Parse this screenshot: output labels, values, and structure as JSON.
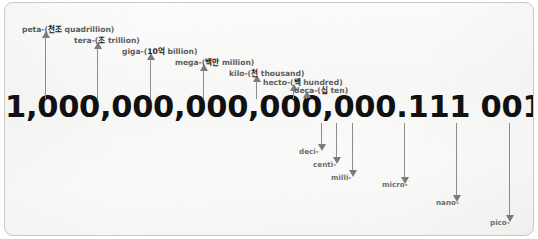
{
  "number": {
    "text": "1,000,000,000,000,000.111 001 001 001",
    "color": "#111111"
  },
  "style": {
    "arrow_color": "#7a7a7a",
    "label_color": "#5e5e5e",
    "border_color": "#c9c9c9",
    "background_color": "#f9f9f8"
  },
  "big_prefixes": [
    {
      "prefix": "peta-",
      "paren_open": "(",
      "korean": "천조",
      "english": "quadrillion",
      "paren_close": ")",
      "arrow_x": 40,
      "arrow_top": 28,
      "arrow_bottom": 96,
      "label_x": 17,
      "label_y": 20
    },
    {
      "prefix": "tera-",
      "paren_open": "(",
      "korean": "조",
      "english": "trillion",
      "paren_close": ")",
      "arrow_x": 92,
      "arrow_top": 39,
      "arrow_bottom": 96,
      "label_x": 69,
      "label_y": 31
    },
    {
      "prefix": "giga-",
      "paren_open": "(",
      "korean": "10억",
      "english": "billion",
      "paren_close": ")",
      "arrow_x": 145,
      "arrow_top": 50,
      "arrow_bottom": 96,
      "label_x": 117,
      "label_y": 42
    },
    {
      "prefix": "mega-",
      "paren_open": "(",
      "korean": "백만",
      "english": "million",
      "paren_close": ")",
      "arrow_x": 198,
      "arrow_top": 61,
      "arrow_bottom": 96,
      "label_x": 170,
      "label_y": 53
    },
    {
      "prefix": "kilo-",
      "paren_open": "(",
      "korean": "천",
      "english": "thousand",
      "paren_close": ")",
      "arrow_x": 251,
      "arrow_top": 72,
      "arrow_bottom": 96,
      "label_x": 224,
      "label_y": 64
    },
    {
      "prefix": "hecto-",
      "paren_open": "(",
      "korean": "백",
      "english": "hundred",
      "paren_close": ")",
      "arrow_x": 288,
      "arrow_top": 81,
      "arrow_bottom": 96,
      "label_x": 258,
      "label_y": 73
    },
    {
      "prefix": "deca-",
      "paren_open": "(",
      "korean": "십",
      "english": "ten",
      "paren_close": ")",
      "arrow_x": 301,
      "arrow_top": 88,
      "arrow_bottom": 96,
      "label_x": 289,
      "label_y": 81
    }
  ],
  "small_prefixes": [
    {
      "prefix": "deci-",
      "arrow_x": 316,
      "arrow_top": 120,
      "arrow_bottom": 148,
      "label_x": 294,
      "label_y": 144
    },
    {
      "prefix": "centi-",
      "arrow_x": 331,
      "arrow_top": 120,
      "arrow_bottom": 161,
      "label_x": 308,
      "label_y": 157
    },
    {
      "prefix": "milli-",
      "arrow_x": 347,
      "arrow_top": 120,
      "arrow_bottom": 174,
      "label_x": 326,
      "label_y": 170
    },
    {
      "prefix": "micro-",
      "arrow_x": 399,
      "arrow_top": 120,
      "arrow_bottom": 181,
      "label_x": 377,
      "label_y": 177
    },
    {
      "prefix": "nano-",
      "arrow_x": 451,
      "arrow_top": 120,
      "arrow_bottom": 199,
      "label_x": 431,
      "label_y": 195
    },
    {
      "prefix": "pico-",
      "arrow_x": 504,
      "arrow_top": 120,
      "arrow_bottom": 219,
      "label_x": 485,
      "label_y": 215
    }
  ]
}
